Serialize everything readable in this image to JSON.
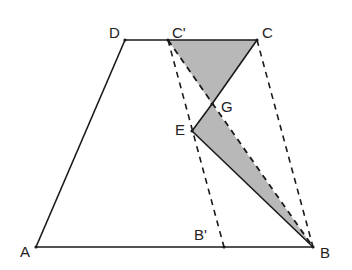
{
  "diagram": {
    "type": "geometry",
    "colors": {
      "line": "#1a1a1a",
      "shade": "#b8b8b8",
      "background": "#ffffff"
    },
    "points": {
      "A": {
        "label": "A",
        "x": 36,
        "y": 247
      },
      "B": {
        "label": "B",
        "x": 313,
        "y": 247
      },
      "C": {
        "label": "C",
        "x": 257,
        "y": 40
      },
      "D": {
        "label": "D",
        "x": 125,
        "y": 40
      },
      "C'": {
        "label": "C'",
        "x": 168,
        "y": 40
      },
      "B'": {
        "label": "B'",
        "x": 224,
        "y": 247
      },
      "E": {
        "label": "E",
        "x": 192,
        "y": 131
      },
      "G": {
        "label": "G",
        "x": 212,
        "y": 104
      }
    },
    "labels": {
      "A": "A",
      "B": "B",
      "C": "C",
      "D": "D",
      "C_prime": "C'",
      "B_prime": "B'",
      "E": "E",
      "G": "G"
    },
    "solid_segments": [
      [
        "A",
        "B"
      ],
      [
        "A",
        "D"
      ],
      [
        "D",
        "C"
      ],
      [
        "C",
        "G"
      ],
      [
        "G",
        "E"
      ],
      [
        "E",
        "B"
      ]
    ],
    "dashed_segments": [
      [
        "C'",
        "B'"
      ],
      [
        "C",
        "B"
      ],
      [
        "C'",
        "B"
      ]
    ],
    "shaded_regions": [
      [
        "C'",
        "C",
        "G"
      ],
      [
        "E",
        "G",
        "B"
      ]
    ]
  }
}
